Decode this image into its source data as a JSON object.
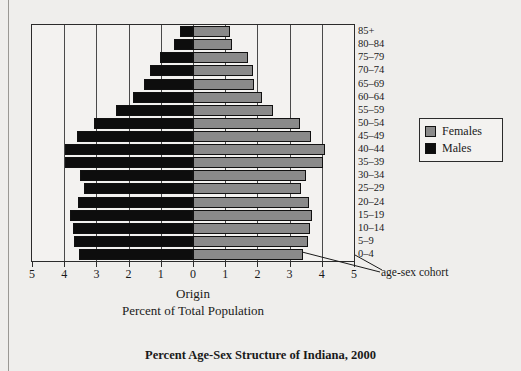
{
  "figure": {
    "title": "Percent Age-Sex Structure of Indiana, 2000",
    "origin_caption": "Origin",
    "axis_caption": "Percent of Total Population",
    "annotation": "age-sex cohort"
  },
  "legend": {
    "items": [
      {
        "label": "Females",
        "color": "#8a8a8a"
      },
      {
        "label": "Males",
        "color": "#0d0d0d"
      }
    ]
  },
  "chart_data": {
    "type": "bar",
    "subtype": "population-pyramid",
    "title": "Percent Age-Sex Structure of Indiana, 2000",
    "xlabel": "Percent of Total Population",
    "ylabel": "",
    "xlim": [
      -5,
      5
    ],
    "xticks": [
      5,
      4,
      3,
      2,
      1,
      0,
      1,
      2,
      3,
      4,
      5
    ],
    "xtick_values": [
      -5,
      -4,
      -3,
      -2,
      -1,
      0,
      1,
      2,
      3,
      4,
      5
    ],
    "grid": true,
    "legend_position": "right",
    "categories": [
      "85+",
      "80–84",
      "75–79",
      "70–74",
      "65–69",
      "60–64",
      "55–59",
      "50–54",
      "45–49",
      "40–44",
      "35–39",
      "30–34",
      "25–29",
      "20–24",
      "15–19",
      "10–14",
      "5–9",
      "0–4"
    ],
    "series": [
      {
        "name": "Males",
        "color": "#0d0d0d",
        "direction": "left",
        "values": [
          0.4,
          0.59,
          1.04,
          1.35,
          1.53,
          1.86,
          2.38,
          3.08,
          3.61,
          3.98,
          3.98,
          3.51,
          3.4,
          3.57,
          3.81,
          3.72,
          3.7,
          3.55
        ]
      },
      {
        "name": "Females",
        "color": "#8a8a8a",
        "direction": "right",
        "values": [
          1.14,
          1.22,
          1.71,
          1.86,
          1.88,
          2.14,
          2.48,
          3.32,
          3.66,
          4.1,
          4.05,
          3.51,
          3.35,
          3.61,
          3.68,
          3.62,
          3.56,
          3.42
        ]
      }
    ]
  }
}
